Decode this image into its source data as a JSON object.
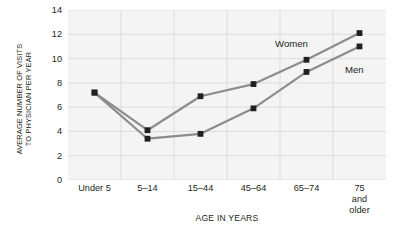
{
  "chart_data": {
    "type": "line",
    "title": "",
    "xlabel": "AGE IN YEARS",
    "ylabel": "AVERAGE NUMBER OF VISITS TO PHYSICIAN PER YEAR",
    "ylabel_line1": "AVERAGE NUMBER OF VISITS",
    "ylabel_line2": "TO PHYSICIAN PER YEAR",
    "categories": [
      "Under 5",
      "5–14",
      "15–44",
      "45–64",
      "65–74",
      "75 and\nolder"
    ],
    "ylim": [
      0,
      14
    ],
    "yticks": [
      0,
      2,
      4,
      6,
      8,
      10,
      12,
      14
    ],
    "ytick_labels": [
      "0",
      "2",
      "4",
      "6",
      "8",
      "10",
      "12",
      "14"
    ],
    "grid": true,
    "legend_position": "inline-annotation",
    "series": [
      {
        "name": "Women",
        "color": "#8c8c8c",
        "marker": "square",
        "marker_color": "#231f20",
        "values": [
          7.2,
          4.1,
          6.9,
          7.9,
          9.9,
          12.1
        ]
      },
      {
        "name": "Men",
        "color": "#8c8c8c",
        "marker": "square",
        "marker_color": "#231f20",
        "values": [
          7.2,
          3.4,
          3.8,
          5.9,
          8.9,
          11.0
        ]
      }
    ],
    "annotations": [
      {
        "text": "Women",
        "series": "Women"
      },
      {
        "text": "Men",
        "series": "Men"
      }
    ]
  },
  "colors": {
    "plot_background": "#f4f4f4",
    "gridline": "#dcdcdc",
    "line": "#8c8c8c",
    "marker": "#231f20",
    "text": "#231f20"
  }
}
